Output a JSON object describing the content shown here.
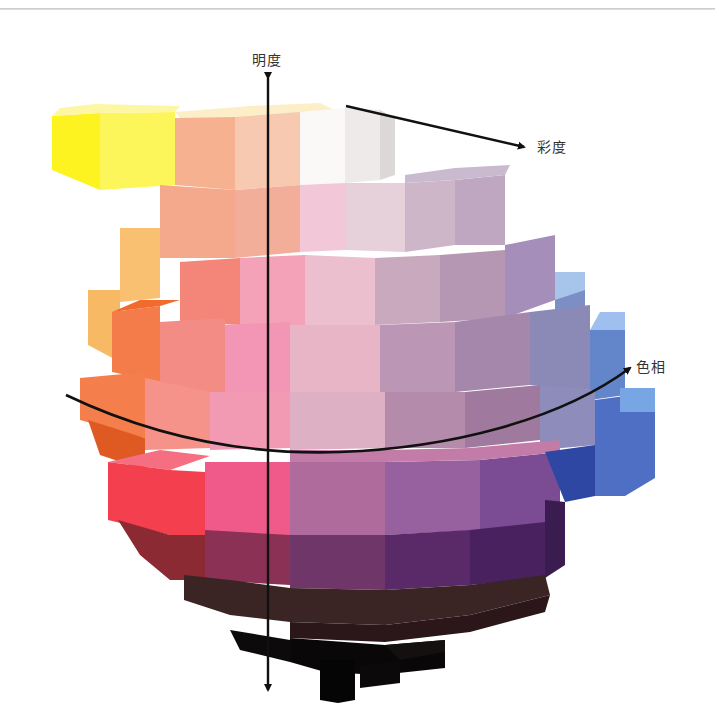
{
  "figure": {
    "axis_labels": {
      "value": "明度",
      "chroma": "彩度",
      "hue": "色相"
    },
    "axis_label_positions": {
      "value": [
        252,
        49
      ],
      "chroma": [
        537,
        136
      ],
      "hue": [
        636,
        356
      ]
    },
    "colors": {
      "axis_line": "#111111",
      "label_text": "#333333",
      "top_rule": "#cfcfcf",
      "background": "#ffffff"
    },
    "blocks": [
      {
        "name": "yellow-front",
        "points": "52,116 100,113 100,190 52,170",
        "fill": "#fdf321"
      },
      {
        "name": "yellow-side",
        "points": "100,113 175,112 175,185 100,190",
        "fill": "#fcf65a"
      },
      {
        "name": "yellow-top",
        "points": "52,116 100,113 175,112 180,106 95,104 60,108",
        "fill": "#fdf7a4"
      },
      {
        "name": "cream-top",
        "points": "175,112 250,106 320,103 335,110 250,117 180,118",
        "fill": "#fcefc8"
      },
      {
        "name": "peach-upper-1",
        "points": "175,118 235,117 235,190 175,185",
        "fill": "#f6b191"
      },
      {
        "name": "peach-upper-2",
        "points": "235,117 300,112 300,185 235,190",
        "fill": "#f8c9b1"
      },
      {
        "name": "white-top-1",
        "points": "300,112 345,108 345,183 300,185",
        "fill": "#fbf8f8"
      },
      {
        "name": "white-top-2",
        "points": "345,108 380,110 380,180 345,183",
        "fill": "#eeeaea"
      },
      {
        "name": "white-top-side",
        "points": "380,110 395,118 395,175 380,180",
        "fill": "#dcd8d8"
      },
      {
        "name": "peach-mid-1",
        "points": "160,185 235,190 235,258 160,258",
        "fill": "#f4a98c"
      },
      {
        "name": "peach-mid-2",
        "points": "235,190 300,185 300,252 235,258",
        "fill": "#f3ae9a"
      },
      {
        "name": "pink-light-1",
        "points": "300,185 345,183 345,250 300,252",
        "fill": "#f2c7d8"
      },
      {
        "name": "pink-light-2",
        "points": "345,183 405,183 405,252 345,250",
        "fill": "#e6d0da"
      },
      {
        "name": "mauve-light-1",
        "points": "405,183 455,180 455,245 405,252",
        "fill": "#cdb6c8"
      },
      {
        "name": "mauve-light-2",
        "points": "455,180 505,175 505,245 455,245",
        "fill": "#bfa6c1"
      },
      {
        "name": "lavender-top",
        "points": "405,175 455,168 510,165 505,175 455,180 405,183",
        "fill": "#c9bad0"
      },
      {
        "name": "orange-light",
        "points": "120,228 160,228 160,298 120,302",
        "fill": "#f8c070"
      },
      {
        "name": "orange-light-2",
        "points": "88,290 120,290 120,362 88,345",
        "fill": "#f8b965"
      },
      {
        "name": "salmon-1",
        "points": "180,262 240,258 240,325 180,322",
        "fill": "#f38679"
      },
      {
        "name": "pink-2",
        "points": "240,258 305,255 305,325 240,325",
        "fill": "#f4a2b7"
      },
      {
        "name": "pink-3",
        "points": "305,255 375,258 375,325 305,325",
        "fill": "#ebbfce"
      },
      {
        "name": "mauve-3",
        "points": "375,258 440,255 440,322 375,325",
        "fill": "#c9a9bd"
      },
      {
        "name": "mauve-4",
        "points": "440,255 505,250 505,318 440,322",
        "fill": "#b697b3"
      },
      {
        "name": "lilac-4",
        "points": "505,245 555,235 555,300 505,318",
        "fill": "#a58eb9"
      },
      {
        "name": "blue-light-1",
        "points": "555,272 585,272 585,300 555,300",
        "fill": "#a7c4ea"
      },
      {
        "name": "blue-side-1",
        "points": "555,300 585,290 585,355 555,360",
        "fill": "#7b8fc4"
      },
      {
        "name": "orange-mid",
        "points": "112,312 160,306 160,382 112,372",
        "fill": "#f47c4a"
      },
      {
        "name": "orange-mid-top",
        "points": "112,312 160,306 180,300 140,300",
        "fill": "#f36a2d"
      },
      {
        "name": "salmon-mid",
        "points": "160,322 225,318 225,395 160,392",
        "fill": "#f28c84"
      },
      {
        "name": "pink-mid",
        "points": "225,325 290,322 290,392 225,395",
        "fill": "#f395b5"
      },
      {
        "name": "pink-light-mid",
        "points": "290,325 380,325 380,392 290,392",
        "fill": "#e8b5c7"
      },
      {
        "name": "mauve-mid",
        "points": "380,325 455,322 455,392 380,392",
        "fill": "#bb97b5"
      },
      {
        "name": "mauve-mid-2",
        "points": "455,322 530,312 530,385 455,392",
        "fill": "#a587ab"
      },
      {
        "name": "blue-mid",
        "points": "590,330 625,330 625,395 590,400",
        "fill": "#6385ca"
      },
      {
        "name": "blue-mid-top",
        "points": "590,330 625,330 625,312 600,312",
        "fill": "#9fc0ee"
      },
      {
        "name": "steel-mid",
        "points": "530,312 590,305 590,390 530,385",
        "fill": "#8b89b5"
      },
      {
        "name": "orange-eq",
        "points": "80,378 145,372 145,438 80,420",
        "fill": "#f47e4c"
      },
      {
        "name": "orange-eq-dark",
        "points": "88,420 145,438 145,470 100,455",
        "fill": "#de5a22"
      },
      {
        "name": "salmon-eq",
        "points": "145,378 210,392 210,448 145,450",
        "fill": "#f5928a"
      },
      {
        "name": "pink-eq",
        "points": "210,392 290,392 290,448 210,450",
        "fill": "#f29ab4"
      },
      {
        "name": "rose-eq",
        "points": "290,392 385,392 385,448 290,450",
        "fill": "#ddb0c3"
      },
      {
        "name": "mauve-eq",
        "points": "385,392 465,392 465,448 385,448",
        "fill": "#b58bab"
      },
      {
        "name": "mauve-eq-2",
        "points": "465,392 540,385 540,440 465,448",
        "fill": "#a07a9e"
      },
      {
        "name": "blue-eq",
        "points": "540,385 595,390 595,445 540,450",
        "fill": "#8d8cba"
      },
      {
        "name": "blue-eq-2",
        "points": "595,400 655,392 655,478 625,496 595,496",
        "fill": "#4f6fc4"
      },
      {
        "name": "blue-eq-top",
        "points": "620,388 655,388 655,412 620,412",
        "fill": "#78a6e4"
      },
      {
        "name": "red-top",
        "points": "108,462 160,450 210,456 170,470",
        "fill": "#f56e82"
      },
      {
        "name": "red-front",
        "points": "108,462 170,470 205,472 205,535 170,535 108,520",
        "fill": "#f43f4f"
      },
      {
        "name": "pink-deep",
        "points": "205,462 290,462 290,535 205,535",
        "fill": "#f05a8a"
      },
      {
        "name": "magenta-1",
        "points": "290,462 385,462 385,535 290,535",
        "fill": "#ae6b9c"
      },
      {
        "name": "purple-1",
        "points": "385,462 480,460 480,530 385,535",
        "fill": "#97609f"
      },
      {
        "name": "purple-2",
        "points": "480,460 560,452 560,522 480,530",
        "fill": "#7b4c93"
      },
      {
        "name": "magenta-top",
        "points": "290,450 385,450 470,448 560,440 560,452 480,460 385,462 290,462",
        "fill": "#c27ca7"
      },
      {
        "name": "navy-eq",
        "points": "545,452 595,445 595,496 565,502",
        "fill": "#2d47a3"
      },
      {
        "name": "maroon-1",
        "points": "118,520 170,535 205,535 205,580 170,580 140,555",
        "fill": "#8c2a33"
      },
      {
        "name": "maroon-2",
        "points": "205,530 290,535 290,585 205,580",
        "fill": "#8b3155"
      },
      {
        "name": "plum-1",
        "points": "290,535 385,535 385,590 290,588",
        "fill": "#6f3769"
      },
      {
        "name": "plum-2",
        "points": "385,535 470,530 470,585 385,590",
        "fill": "#5a2a68"
      },
      {
        "name": "plum-3",
        "points": "470,530 545,522 545,578 470,585",
        "fill": "#49215f"
      },
      {
        "name": "plum-side",
        "points": "545,500 565,502 565,565 545,578",
        "fill": "#3a1c50"
      },
      {
        "name": "dark-brown",
        "points": "184,575 230,580 290,588 385,590 470,585 545,575 550,595 470,615 385,625 290,622 230,615 184,600",
        "fill": "#3a2524"
      },
      {
        "name": "dark-brown-2",
        "points": "290,622 385,625 470,615 550,595 545,612 470,632 385,642 290,638",
        "fill": "#2b1719"
      },
      {
        "name": "black-1",
        "points": "230,630 290,640 290,662 240,650",
        "fill": "#0c0a0a"
      },
      {
        "name": "black-2",
        "points": "290,638 385,645 445,640 445,668 380,675 325,672 290,662",
        "fill": "#090707"
      },
      {
        "name": "black-3",
        "points": "385,645 445,640 445,652 400,660",
        "fill": "#141010"
      },
      {
        "name": "black-stem",
        "points": "320,660 355,660 355,700 338,703 320,700",
        "fill": "#050505"
      },
      {
        "name": "black-side",
        "points": "360,666 400,660 400,683 360,688",
        "fill": "#0b0909"
      }
    ],
    "axes": {
      "value_axis": {
        "x": 268,
        "y_top": 78,
        "y_bottom": 690
      },
      "chroma_axis": {
        "x1": 346,
        "y1": 106,
        "x2": 524,
        "y2": 147
      },
      "hue_curve": "M 66 395 C 160 440, 250 455, 340 452 C 450 448, 560 420, 630 368"
    }
  }
}
